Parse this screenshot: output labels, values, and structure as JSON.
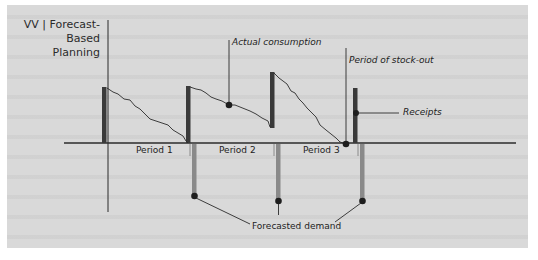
{
  "title": {
    "line1": "VV | Forecast-Based",
    "line2": "Planning"
  },
  "annotations": {
    "actual_consumption": "Actual consumption",
    "period_of_stock_out": "Period of stock-out",
    "receipts": "Receipts",
    "forecasted_demand": "Forecasted demand"
  },
  "periods": [
    {
      "label": "Period 1"
    },
    {
      "label": "Period 2"
    },
    {
      "label": "Period 3"
    }
  ],
  "colors": {
    "background": "#d9d9d9",
    "axis": "#2b2b2b",
    "receipt_bar": "#3a3a3a",
    "forecast_bar": "#8a8a8a",
    "marker": "#1e1e1e"
  }
}
